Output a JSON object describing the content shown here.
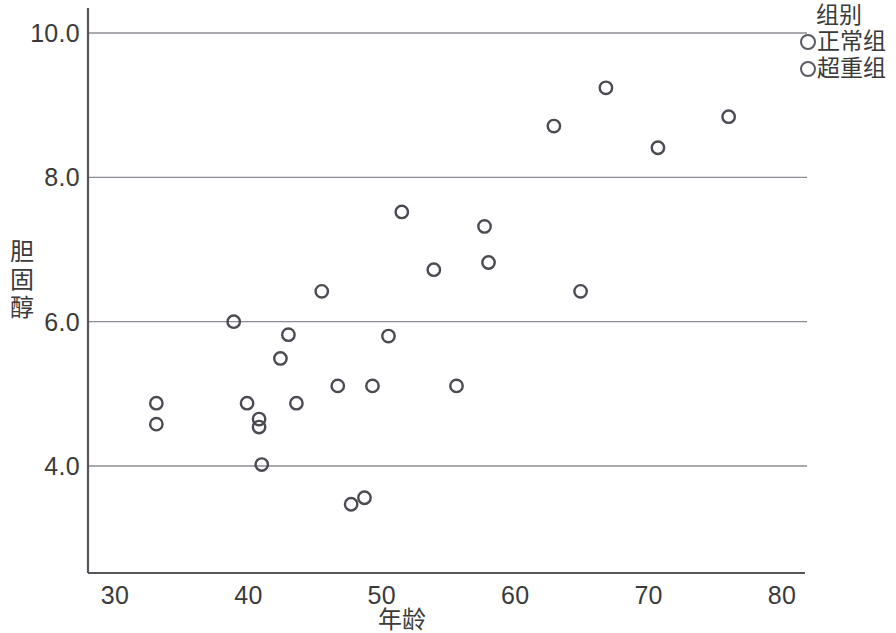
{
  "chart_data": {
    "type": "scatter",
    "title": "",
    "xlabel": "年龄",
    "ylabel": "胆固醇",
    "xlim": [
      27,
      84
    ],
    "ylim": [
      3.0,
      10.4
    ],
    "xticks": [
      30,
      40,
      50,
      60,
      70,
      80
    ],
    "xtick_labels": [
      "30",
      "40",
      "50",
      "60",
      "70",
      "80"
    ],
    "yticks": [
      4.0,
      6.0,
      8.0,
      10.0
    ],
    "ytick_labels": [
      "4.0",
      "6.0",
      "8.0",
      "10.0"
    ],
    "grid": "horizontal",
    "legend_position": "top-right",
    "legend_title": "组别",
    "marker": "open-circle",
    "marker_color": "#4a4a52",
    "series": [
      {
        "name": "正常组",
        "points": [
          [
            33.1,
            4.87
          ],
          [
            33.1,
            4.58
          ],
          [
            38.9,
            6.0
          ],
          [
            39.9,
            4.87
          ],
          [
            40.8,
            4.65
          ],
          [
            40.8,
            4.54
          ],
          [
            41.0,
            4.02
          ],
          [
            42.4,
            5.49
          ],
          [
            43.0,
            5.82
          ],
          [
            43.6,
            4.87
          ],
          [
            45.5,
            6.42
          ],
          [
            46.7,
            5.11
          ],
          [
            47.7,
            3.47
          ],
          [
            48.7,
            3.56
          ],
          [
            49.3,
            5.11
          ],
          [
            50.5,
            5.8
          ],
          [
            51.5,
            7.52
          ],
          [
            53.9,
            6.72
          ],
          [
            55.6,
            5.11
          ],
          [
            57.7,
            7.32
          ],
          [
            58.0,
            6.82
          ],
          [
            62.9,
            8.71
          ],
          [
            64.9,
            6.42
          ],
          [
            66.8,
            9.24
          ],
          [
            70.7,
            8.41
          ],
          [
            76.0,
            8.84
          ]
        ]
      },
      {
        "name": "超重组",
        "points": []
      }
    ]
  },
  "axes": {
    "y_title_chars": [
      "胆",
      "固",
      "醇"
    ],
    "x_title": "年龄"
  },
  "legend": {
    "title": "组别",
    "entries": [
      {
        "label": "正常组",
        "marker": "open-circle"
      },
      {
        "label": "超重组",
        "marker": "open-circle"
      }
    ]
  }
}
